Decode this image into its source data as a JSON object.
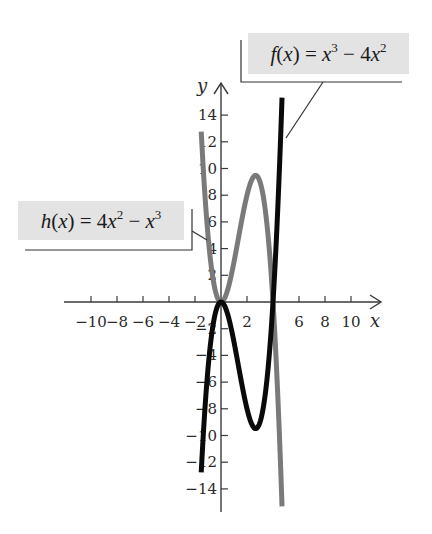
{
  "chart_data": {
    "type": "line",
    "title": "",
    "xlabel": "x",
    "ylabel": "y",
    "xlim": [
      -11,
      12
    ],
    "ylim": [
      -15,
      16
    ],
    "grid": false,
    "x_ticks": [
      -10,
      -8,
      -6,
      -4,
      -2,
      2,
      6,
      8,
      10
    ],
    "x_tick_labels": [
      "−10",
      "−8",
      "−6",
      "−4",
      "−2",
      "2",
      "6",
      "8",
      "10"
    ],
    "y_ticks": [
      14,
      12,
      10,
      8,
      6,
      4,
      2,
      -2,
      -4,
      -6,
      -8,
      -10,
      -12,
      -14
    ],
    "y_tick_labels": [
      "14",
      "12",
      "10",
      "8",
      "6",
      "4",
      "2",
      "−2",
      "−4",
      "−6",
      "−8",
      "−10",
      "−12",
      "−14"
    ],
    "series": [
      {
        "name": "f(x) = x^3 − 4x^2",
        "expression": "x^3 - 4x^2",
        "color": "#0a0a0a",
        "x_range": [
          -1.52,
          4.8
        ],
        "key_points": [
          [
            0,
            0
          ],
          [
            2.667,
            -9.48
          ],
          [
            4,
            0
          ]
        ]
      },
      {
        "name": "h(x) = 4x^2 − x^3",
        "expression": "4x^2 - x^3",
        "color": "#7a7a7a",
        "x_range": [
          -1.52,
          4.8
        ],
        "key_points": [
          [
            0,
            0
          ],
          [
            2.667,
            9.48
          ],
          [
            4,
            0
          ]
        ]
      }
    ],
    "annotations": [
      {
        "text": "f(x) = x^3 − 4x^2",
        "points_to": "f"
      },
      {
        "text": "h(x) = 4x^2 − x^3",
        "points_to": "h"
      }
    ]
  },
  "labels": {
    "f": {
      "name": "f",
      "var": "x",
      "eq": "=",
      "t1": "x",
      "e1": "3",
      "op": "−",
      "coef": "4",
      "t2": "x",
      "e2": "2"
    },
    "h": {
      "name": "h",
      "var": "x",
      "eq": "=",
      "coef": "4",
      "t1": "x",
      "e1": "2",
      "op": "−",
      "t2": "x",
      "e2": "3"
    }
  },
  "axes": {
    "x_name": "x",
    "y_name": "y"
  },
  "colors": {
    "f_curve": "#0a0a0a",
    "h_curve": "#7a7a7a",
    "axis": "#3a3a3a",
    "label_bg": "#e3e3e3"
  }
}
